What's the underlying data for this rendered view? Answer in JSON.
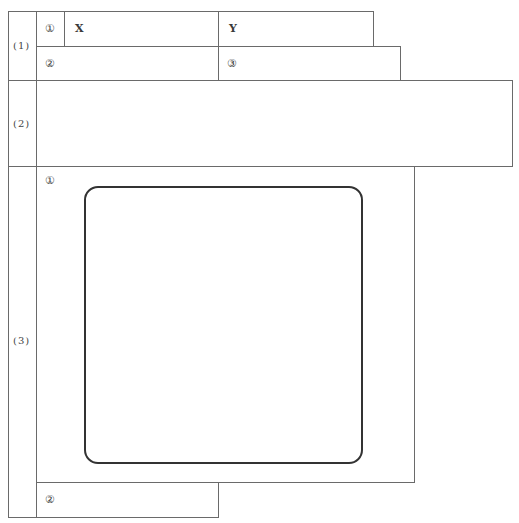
{
  "form": {
    "sections": [
      {
        "label": "(1)",
        "row1": {
          "marker": "①",
          "field_x": "X",
          "field_y": "Y"
        },
        "row2": {
          "marker_left": "②",
          "marker_right": "③"
        }
      },
      {
        "label": "(2)"
      },
      {
        "label": "(3)",
        "drawing_area": {
          "marker": "①"
        },
        "footer": {
          "marker": "②"
        }
      }
    ]
  },
  "colors": {
    "line": "#6a6a6a",
    "rounded_frame": "#333333",
    "background": "#ffffff"
  }
}
